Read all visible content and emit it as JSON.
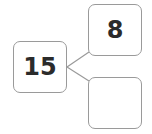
{
  "diagram": {
    "type": "number-bond",
    "whole": {
      "value": "15"
    },
    "parts": [
      {
        "value": "8"
      },
      {
        "value": ""
      }
    ],
    "colors": {
      "border": "#9a9a9a",
      "text": "#2b2b2b",
      "background": "#ffffff"
    }
  }
}
